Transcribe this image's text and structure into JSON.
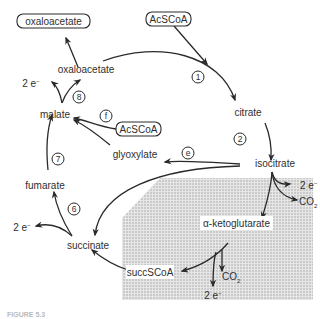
{
  "diagram": {
    "type": "metabolic-pathway",
    "metabolites": {
      "oxaloacetate_boxed": "oxaloacetate",
      "acscoa_top": "AcSCoA",
      "oxaloacetate": "oxaloacetate",
      "citrate": "citrate",
      "malate": "malate",
      "acscoa_mid": "AcSCoA",
      "glyoxylate": "glyoxylate",
      "isocitrate": "isocitrate",
      "fumarate": "fumarate",
      "alpha_ketoglutarate": "α-ketoglutarate",
      "succinate": "succinate",
      "succscoa": "succSCoA"
    },
    "byproducts": {
      "electrons": "2 e",
      "electron_superscript": "−",
      "co2": "CO",
      "co2_subscript": "2"
    },
    "step_labels": {
      "s1": "1",
      "s2": "2",
      "s6": "6",
      "s7": "7",
      "s8": "8",
      "se": "e",
      "sf": "f"
    },
    "caption": "FIGURE 5.3",
    "colors": {
      "line": "#2a2a2a",
      "shade": "#d9d9d9"
    }
  }
}
